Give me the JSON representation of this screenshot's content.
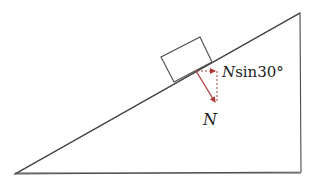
{
  "diagram": {
    "type": "incline-force-diagram",
    "incline_angle": "30°",
    "labels": {
      "normal_force": "N",
      "horizontal_component_var": "N",
      "horizontal_component_fn": "sin30°"
    },
    "colors": {
      "outline": "#4a4a4a",
      "force": "#b03a3a",
      "text": "#222222"
    },
    "elements": [
      "incline-triangle",
      "block",
      "normal-force-arrow",
      "horizontal-component-arrow",
      "vertical-dashed-line"
    ]
  }
}
